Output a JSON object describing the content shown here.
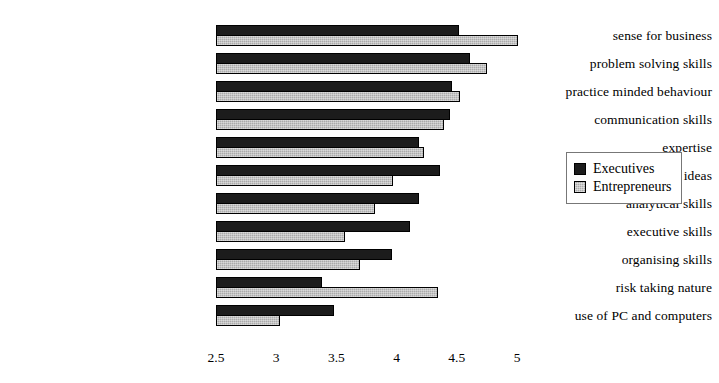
{
  "chart_data": {
    "type": "bar",
    "orientation": "horizontal",
    "title": "",
    "subtitle": "",
    "xlabel": "",
    "ylabel": "",
    "xlim": [
      2.5,
      5.15
    ],
    "xticks": [
      2.5,
      3,
      3.5,
      4,
      4.5,
      5
    ],
    "xtick_labels": [
      "2.5",
      "3",
      "3.5",
      "4",
      "4.5",
      "5"
    ],
    "grid": false,
    "legend_position": "right",
    "categories": [
      "sense for business",
      "problem solving skills",
      "practice minded behaviour",
      "communication skills",
      "expertise",
      "ability to represent ideas",
      "analytical skills",
      "executive skills",
      "organising skills",
      "risk taking nature",
      "use of PC and computers"
    ],
    "series": [
      {
        "name": "Executives",
        "color": "#1c1c1c",
        "values": [
          4.52,
          4.61,
          4.46,
          4.44,
          4.19,
          4.36,
          4.19,
          4.11,
          3.96,
          3.38,
          3.48
        ]
      },
      {
        "name": "Entrepreneurs",
        "color": "#ababab",
        "values": [
          5.01,
          4.75,
          4.53,
          4.39,
          4.23,
          3.97,
          3.82,
          3.57,
          3.7,
          4.34,
          3.03
        ]
      }
    ]
  },
  "legend": {
    "items": [
      {
        "label": "Executives",
        "swatch": "dark-square-icon"
      },
      {
        "label": "Entrepreneurs",
        "swatch": "hatched-square-icon"
      }
    ]
  }
}
